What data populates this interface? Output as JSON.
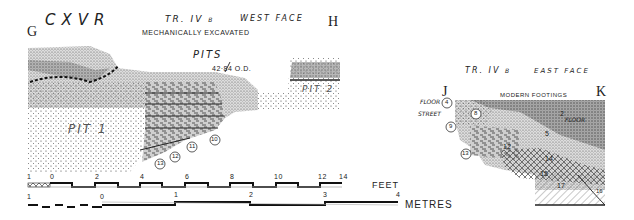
{
  "figure": {
    "site_code": "CXVR",
    "west_section": {
      "trench": "TR. IV",
      "trench_suffix": "B",
      "face": "WEST FACE",
      "note": "MECHANICALLY EXCAVATED",
      "left_marker": "G",
      "right_marker": "H",
      "pits_label": "PITS",
      "level": "42·84 O.D.",
      "pit1_label": "PIT 1",
      "pit2_label": "PIT 2",
      "layer_labels": [
        "FLOOR",
        "STREET"
      ],
      "layer_numbers": [
        "10",
        "11",
        "12",
        "13"
      ]
    },
    "east_section": {
      "trench": "TR. IV",
      "trench_suffix": "B",
      "face": "EAST FACE",
      "left_marker": "J",
      "right_marker": "K",
      "top_note": "MODERN FOOTINGS",
      "side_labels": [
        "FLOOR",
        "STREET"
      ],
      "layer_numbers": [
        "4",
        "8",
        "9",
        "13",
        "2",
        "5",
        "12",
        "14",
        "15",
        "17",
        "16"
      ],
      "floor_label": "FLOOR"
    },
    "scale_feet": {
      "unit": "FEET",
      "ticks": [
        "1",
        "0",
        "2",
        "4",
        "6",
        "8",
        "10",
        "12",
        "14"
      ]
    },
    "scale_metres": {
      "unit": "METRES",
      "ticks": [
        "1",
        "0",
        "1",
        "2",
        "3",
        "4"
      ]
    }
  }
}
